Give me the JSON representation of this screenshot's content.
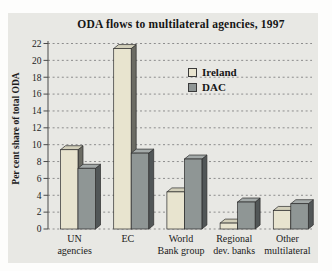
{
  "chart": {
    "panel_bg": "#e8e8e4",
    "grid_color": "#8d8d8d",
    "axis_color": "#4a4a4a",
    "text_color": "#1b1b1b",
    "bar_stroke": "#2b2b2b"
  },
  "chart_data": {
    "type": "bar",
    "title": "ODA flows to multilateral agencies, 1997",
    "xlabel": "",
    "ylabel": "Per cent share of total ODA",
    "categories": [
      "UN agencies",
      "EC",
      "World Bank group",
      "Regional dev. banks",
      "Other multilateral"
    ],
    "category_lines": [
      [
        "UN",
        "agencies"
      ],
      [
        "EC"
      ],
      [
        "World",
        "Bank group"
      ],
      [
        "Regional",
        "dev. banks"
      ],
      [
        "Other",
        "multilateral"
      ]
    ],
    "series": [
      {
        "name": "Ireland",
        "values": [
          9.4,
          21.4,
          4.4,
          0.7,
          2.2
        ],
        "color": "#e8e4cf",
        "side_color": "#6b6b63",
        "top_color": "#d2cfba"
      },
      {
        "name": "DAC",
        "values": [
          7.2,
          9.0,
          8.3,
          3.2,
          3.0
        ],
        "color": "#8f9695",
        "side_color": "#515657",
        "top_color": "#a3a9a8"
      }
    ],
    "ylim": [
      0,
      22
    ],
    "ytick_step": 2,
    "yticks": [
      0,
      2,
      4,
      6,
      8,
      10,
      12,
      14,
      16,
      18,
      20,
      22
    ],
    "grid": "dashed horizontal",
    "legend_position": "upper right inside plot"
  }
}
